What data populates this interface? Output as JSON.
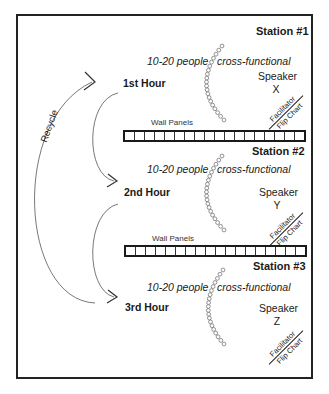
{
  "diagram": {
    "recycle_label": "Recycle",
    "wall_panels": [
      {
        "label": "Wall Panels",
        "cells": 18
      },
      {
        "label": "Wall Panels",
        "cells": 18
      }
    ],
    "stations": [
      {
        "title": "Station #1",
        "hour": "1st Hour",
        "people": "10-20 people",
        "type": "cross-functional",
        "speaker_label": "Speaker",
        "speaker_id": "X",
        "facilitator": "Facilitator",
        "flip_chart": "Flip Chart"
      },
      {
        "title": "Station #2",
        "hour": "2nd Hour",
        "people": "10-20 people",
        "type": "cross-functional",
        "speaker_label": "Speaker",
        "speaker_id": "Y",
        "facilitator": "Facilitator",
        "flip_chart": "Flip Chart"
      },
      {
        "title": "Station #3",
        "hour": "3rd Hour",
        "people": "10-20 people",
        "type": "cross-functional",
        "speaker_label": "Speaker",
        "speaker_id": "Z",
        "facilitator": "Facilitator",
        "flip_chart": "Flip Chart"
      }
    ]
  }
}
